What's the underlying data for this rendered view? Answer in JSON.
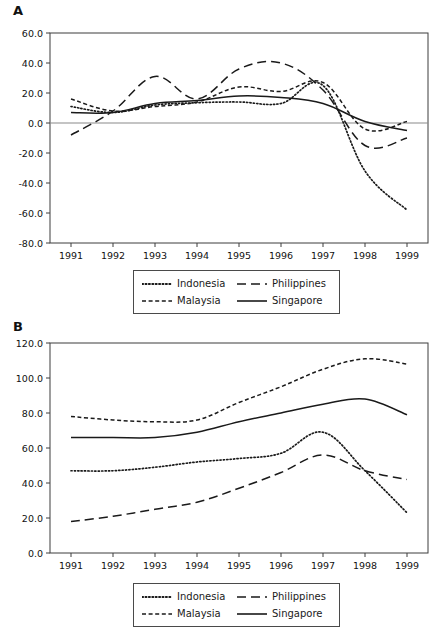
{
  "figure": {
    "panels": [
      {
        "id": "A",
        "label": "A",
        "legend": {
          "entries": [
            {
              "name": "Indonesia",
              "style": "dotted"
            },
            {
              "name": "Philippines",
              "style": "long-dash"
            },
            {
              "name": "Malaysia",
              "style": "short-dash"
            },
            {
              "name": "Singapore",
              "style": "solid"
            }
          ]
        }
      },
      {
        "id": "B",
        "label": "B",
        "legend": {
          "entries": [
            {
              "name": "Indonesia",
              "style": "dotted"
            },
            {
              "name": "Philippines",
              "style": "long-dash"
            },
            {
              "name": "Malaysia",
              "style": "short-dash"
            },
            {
              "name": "Singapore",
              "style": "solid"
            }
          ]
        }
      }
    ]
  },
  "chart_data": [
    {
      "panel": "A",
      "type": "line",
      "title": "A",
      "xlabel": "",
      "ylabel": "",
      "x": [
        1991,
        1992,
        1993,
        1994,
        1995,
        1996,
        1997,
        1998,
        1999
      ],
      "xticklabels": [
        "1991",
        "1992",
        "1993",
        "1994",
        "1995",
        "1996",
        "1997",
        "1998",
        "1999"
      ],
      "yticklabels": [
        "60.0",
        "40.0",
        "20.0",
        "0.0",
        "-20.0",
        "-40.0",
        "-60.0",
        "-80.0"
      ],
      "yticks": [
        60,
        40,
        20,
        0,
        -20,
        -40,
        -60,
        -80
      ],
      "ylim": [
        -80,
        60
      ],
      "xlim": [
        1990.5,
        1999.5
      ],
      "grid": false,
      "zero_line": true,
      "legend_position": "below",
      "series": [
        {
          "name": "Indonesia",
          "style": "dotted",
          "values": [
            11,
            7,
            12,
            13.5,
            14,
            13,
            25,
            -32,
            -58
          ]
        },
        {
          "name": "Malaysia",
          "style": "short-dash",
          "values": [
            16,
            8,
            11,
            14,
            24,
            21,
            27,
            -4,
            1
          ]
        },
        {
          "name": "Philippines",
          "style": "long-dash",
          "values": [
            -8,
            8,
            31,
            16,
            36,
            40,
            22,
            -15,
            -10
          ]
        },
        {
          "name": "Singapore",
          "style": "solid",
          "values": [
            7,
            7,
            13,
            15,
            18,
            17,
            13,
            1,
            -5
          ]
        }
      ]
    },
    {
      "panel": "B",
      "type": "line",
      "title": "B",
      "xlabel": "",
      "ylabel": "",
      "x": [
        1991,
        1992,
        1993,
        1994,
        1995,
        1996,
        1997,
        1998,
        1999
      ],
      "xticklabels": [
        "1991",
        "1992",
        "1993",
        "1994",
        "1995",
        "1996",
        "1997",
        "1998",
        "1999"
      ],
      "yticklabels": [
        "120.0",
        "100.0",
        "80.0",
        "60.0",
        "40.0",
        "20.0",
        "0.0"
      ],
      "yticks": [
        120,
        100,
        80,
        60,
        40,
        20,
        0
      ],
      "ylim": [
        0,
        120
      ],
      "xlim": [
        1990.5,
        1999.5
      ],
      "grid": false,
      "zero_line": false,
      "legend_position": "below",
      "series": [
        {
          "name": "Indonesia",
          "style": "dotted",
          "values": [
            47,
            47,
            49,
            52,
            54,
            57,
            69,
            47,
            23
          ]
        },
        {
          "name": "Malaysia",
          "style": "short-dash",
          "values": [
            78,
            76,
            75,
            76,
            86,
            95,
            105,
            111,
            108
          ]
        },
        {
          "name": "Philippines",
          "style": "long-dash",
          "values": [
            18,
            21,
            25,
            29,
            37,
            46,
            56,
            47,
            42
          ]
        },
        {
          "name": "Singapore",
          "style": "solid",
          "values": [
            66,
            66,
            66,
            69,
            75,
            80,
            85,
            88,
            79
          ]
        }
      ]
    }
  ],
  "style": {
    "line_color": "#1a1a1a",
    "axis_color": "#3d3d3d",
    "zero_line_color": "#8a8a8a",
    "background": "#ffffff"
  }
}
